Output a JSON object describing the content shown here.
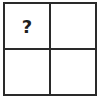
{
  "grid": {
    "rows": 2,
    "cols": 2,
    "cells": [
      {
        "label": "?"
      },
      {
        "label": ""
      },
      {
        "label": ""
      },
      {
        "label": ""
      }
    ]
  }
}
